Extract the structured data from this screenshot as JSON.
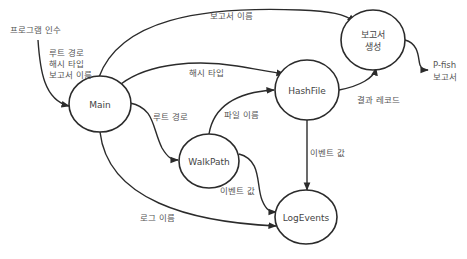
{
  "diagram": {
    "type": "data-flow",
    "nodes": {
      "main": {
        "label": "Main"
      },
      "walkpath": {
        "label": "WalkPath"
      },
      "hashfile": {
        "label": "HashFile"
      },
      "report": {
        "label_line1": "보고서",
        "label_line2": "생성"
      },
      "logevents": {
        "label": "LogEvents"
      }
    },
    "inputs": {
      "program_args": "프로그램 인수"
    },
    "outputs": {
      "pfish_report_line1": "P-fish",
      "pfish_report_line2": "보고서"
    },
    "edges": {
      "args_to_main_line1": "루트 경로",
      "args_to_main_line2": "해시 타입",
      "args_to_main_line3": "보고서 이름",
      "main_to_report": "보고서 이름",
      "main_to_hashfile": "해시 타입",
      "main_to_walkpath": "루트 경로",
      "walkpath_to_hashfile": "파일 이름",
      "hashfile_to_report": "결과 레코드",
      "hashfile_to_logevents": "이벤트 값",
      "walkpath_to_logevents": "이벤트 값",
      "main_to_logevents": "로그 이름"
    }
  }
}
